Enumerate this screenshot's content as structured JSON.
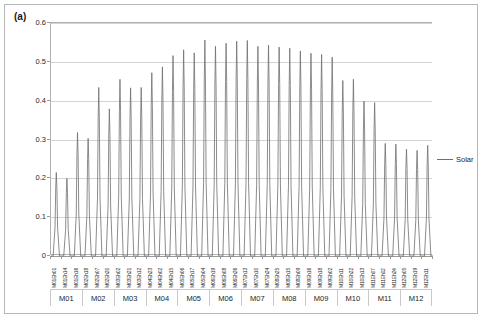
{
  "figure": {
    "panel_label": "(a)"
  },
  "legend": {
    "position": "right",
    "series_name": "Solar",
    "line_color": "#6f6f6f"
  },
  "axes": {
    "y_ticks": [
      "0",
      "0.1",
      "0.2",
      "0.3",
      "0.4",
      "0.5",
      "0.6"
    ],
    "y_min": 0,
    "y_max": 0.6,
    "y_step": 0.1
  },
  "month_groups": [
    "M01",
    "M02",
    "M03",
    "M04",
    "M05",
    "M06",
    "M07",
    "M08",
    "M09",
    "M10",
    "M11",
    "M12"
  ],
  "chart_data": {
    "type": "line",
    "title": "",
    "xlabel": "",
    "ylabel": "",
    "ylim": [
      0,
      0.6
    ],
    "grid": true,
    "legend_position": "right",
    "series": [
      {
        "name": "Solar",
        "color": "#6f6f6f",
        "peaks": [
          0.215,
          0.2,
          0.318,
          0.303,
          0.434,
          0.379,
          0.455,
          0.433,
          0.434,
          0.472,
          0.487,
          0.516,
          0.531,
          0.523,
          0.556,
          0.54,
          0.548,
          0.553,
          0.555,
          0.54,
          0.543,
          0.538,
          0.535,
          0.528,
          0.522,
          0.519,
          0.512,
          0.452,
          0.455,
          0.399,
          0.395,
          0.29,
          0.288,
          0.275,
          0.272,
          0.285
        ]
      }
    ],
    "hour_labels": [
      "M01Eh01",
      "M01Eh14",
      "M01Eh16",
      "M02Eh18",
      "M02Eh07",
      "M02Eh20",
      "M03Eh02",
      "M03Eh21",
      "M03Eh12",
      "M04Eh23",
      "M04Eh02",
      "M04Eh15",
      "M05Eh06",
      "M05Eh17",
      "M05Eh04",
      "M06Eh19",
      "M06Eh08",
      "M06Eh26",
      "M07Eh13",
      "M07Eh10",
      "M07Eh24",
      "M08Eh25",
      "M08Eh15",
      "M08Eh09",
      "M09Eh16",
      "M09Eh18",
      "M09Eh02",
      "M10Eh11",
      "M10Eh22",
      "M10Eh13",
      "M11Eh07",
      "M11Eh02",
      "M11Eh24",
      "M12Eh05",
      "M12Eh19",
      "M12Eh11"
    ]
  }
}
